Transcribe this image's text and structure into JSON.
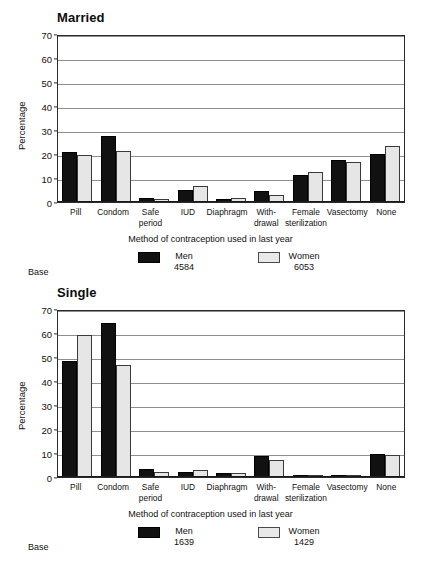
{
  "figure": {
    "axis_title": "Method of contraception used in last year",
    "ylabel": "Percentage",
    "base_label": "Base",
    "series_names": {
      "men": "Men",
      "women": "Women"
    },
    "yticks": [
      "0",
      "10",
      "20",
      "30",
      "40",
      "50",
      "60",
      "70"
    ]
  },
  "chart_data": [
    {
      "type": "bar",
      "title": "Married",
      "xlabel": "Method of contraception used in last year",
      "ylabel": "Percentage",
      "ylim": [
        0,
        70
      ],
      "ytick_values": [
        0,
        10,
        20,
        30,
        40,
        50,
        60,
        70
      ],
      "grid": true,
      "legend_position": "below",
      "categories": [
        "Pill",
        "Condom",
        "Safe period",
        "IUD",
        "Diaphragm",
        "With-drawal",
        "Female sterilization",
        "Vasectomy",
        "None"
      ],
      "category_lines": [
        [
          "Pill",
          ""
        ],
        [
          "Condom",
          ""
        ],
        [
          "Safe",
          "period"
        ],
        [
          "IUD",
          ""
        ],
        [
          "Diaphragm",
          ""
        ],
        [
          "With-",
          "drawal"
        ],
        [
          "Female",
          "sterilization"
        ],
        [
          "Vasectomy",
          ""
        ],
        [
          "None",
          ""
        ]
      ],
      "series": [
        {
          "name": "Men",
          "base": "4584",
          "values": [
            20.9,
            27.5,
            1.5,
            5.1,
            1.2,
            4.7,
            11.3,
            17.5,
            19.8
          ]
        },
        {
          "name": "Women",
          "base": "6053",
          "values": [
            19.4,
            21.4,
            1.2,
            6.7,
            1.5,
            2.8,
            12.5,
            16.6,
            23.3
          ]
        }
      ]
    },
    {
      "type": "bar",
      "title": "Single",
      "xlabel": "Method of contraception used in last year",
      "ylabel": "Percentage",
      "ylim": [
        0,
        70
      ],
      "ytick_values": [
        0,
        10,
        20,
        30,
        40,
        50,
        60,
        70
      ],
      "grid": true,
      "legend_position": "below",
      "categories": [
        "Pill",
        "Condom",
        "Safe period",
        "IUD",
        "Diaphragm",
        "With-drawal",
        "Female sterilization",
        "Vasectomy",
        "None"
      ],
      "category_lines": [
        [
          "Pill",
          ""
        ],
        [
          "Condom",
          ""
        ],
        [
          "Safe",
          "period"
        ],
        [
          "IUD",
          ""
        ],
        [
          "Diaphragm",
          ""
        ],
        [
          "With-",
          "drawal"
        ],
        [
          "Female",
          "sterilization"
        ],
        [
          "Vasectomy",
          ""
        ],
        [
          "None",
          ""
        ]
      ],
      "series": [
        {
          "name": "Men",
          "base": "1639",
          "values": [
            48.5,
            64.0,
            3.4,
            2.1,
            1.5,
            8.8,
            0.8,
            0.0,
            9.6
          ]
        },
        {
          "name": "Women",
          "base": "1429",
          "values": [
            59.0,
            46.6,
            2.2,
            2.8,
            1.6,
            7.1,
            0.2,
            0.3,
            9.3
          ]
        }
      ]
    }
  ],
  "colors": {
    "men": "#111111",
    "women": "#e6e6e6",
    "axis": "#2b2b2b",
    "grid": "#8e8e8e",
    "background": "#ffffff"
  }
}
